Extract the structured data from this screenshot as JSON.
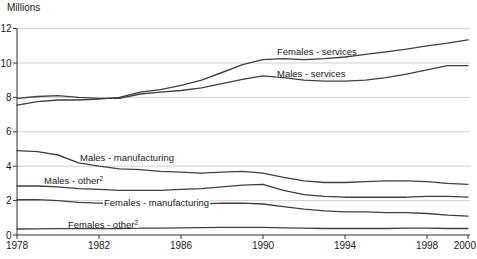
{
  "chart_data": {
    "type": "line",
    "title": "",
    "ylabel": "Millions",
    "xlabel": "",
    "xlim": [
      1978,
      2000
    ],
    "ylim": [
      0,
      12
    ],
    "x_ticks": [
      1978,
      1982,
      1986,
      1990,
      1994,
      1998,
      2000
    ],
    "y_ticks": [
      0,
      2,
      4,
      6,
      8,
      10,
      12
    ],
    "grid": "horizontal",
    "legend_position": "inline-labels",
    "colors": {
      "line": "#3f3f3f",
      "grid": "#cccccc",
      "axis": "#333333",
      "text": "#1a1a1a",
      "label_bg": "#ffffff"
    },
    "x": [
      1978,
      1979,
      1980,
      1981,
      1982,
      1983,
      1984,
      1985,
      1986,
      1987,
      1988,
      1989,
      1990,
      1991,
      1992,
      1993,
      1994,
      1995,
      1996,
      1997,
      1998,
      1999,
      2000
    ],
    "series": [
      {
        "id": "females-services",
        "name": "Females - services",
        "label": {
          "text": "Females - services",
          "sup": "",
          "x": 277,
          "y": 55
        },
        "values": [
          7.55,
          7.75,
          7.85,
          7.85,
          7.9,
          8.0,
          8.3,
          8.45,
          8.7,
          9.0,
          9.45,
          9.9,
          10.2,
          10.25,
          10.2,
          10.25,
          10.35,
          10.5,
          10.65,
          10.8,
          11.0,
          11.15,
          11.35
        ]
      },
      {
        "id": "males-services",
        "name": "Males - services",
        "label": {
          "text": "Males - services",
          "sup": "",
          "x": 277,
          "y": 77
        },
        "values": [
          7.95,
          8.05,
          8.1,
          8.0,
          7.95,
          7.95,
          8.2,
          8.3,
          8.4,
          8.55,
          8.8,
          9.05,
          9.25,
          9.15,
          9.0,
          8.95,
          8.95,
          9.0,
          9.15,
          9.35,
          9.6,
          9.85,
          9.85
        ]
      },
      {
        "id": "males-manufacturing",
        "name": "Males - manufacturing",
        "label": {
          "text": "Males - manufacturing",
          "sup": "",
          "x": 80,
          "y": 161
        },
        "values": [
          4.9,
          4.85,
          4.65,
          4.2,
          4.0,
          3.85,
          3.8,
          3.7,
          3.65,
          3.6,
          3.65,
          3.7,
          3.6,
          3.35,
          3.15,
          3.05,
          3.05,
          3.1,
          3.15,
          3.15,
          3.1,
          3.0,
          2.95
        ]
      },
      {
        "id": "males-other",
        "name": "Males - other",
        "label": {
          "text": "Males - other",
          "sup": "2",
          "x": 44,
          "y": 184
        },
        "values": [
          2.85,
          2.85,
          2.8,
          2.7,
          2.65,
          2.6,
          2.6,
          2.6,
          2.65,
          2.7,
          2.8,
          2.9,
          2.95,
          2.6,
          2.35,
          2.25,
          2.2,
          2.2,
          2.2,
          2.2,
          2.25,
          2.25,
          2.2
        ]
      },
      {
        "id": "females-manufacturing",
        "name": "Females - manufacturing",
        "label": {
          "text": "Females - manufacturing",
          "sup": "",
          "x": 104,
          "y": 206
        },
        "values": [
          2.05,
          2.05,
          2.0,
          1.9,
          1.85,
          1.8,
          1.8,
          1.8,
          1.8,
          1.8,
          1.85,
          1.85,
          1.8,
          1.65,
          1.5,
          1.4,
          1.35,
          1.35,
          1.3,
          1.3,
          1.25,
          1.15,
          1.1
        ]
      },
      {
        "id": "females-other",
        "name": "Females - other",
        "label": {
          "text": "Females - other",
          "sup": "2",
          "x": 68,
          "y": 228
        },
        "values": [
          0.35,
          0.36,
          0.37,
          0.37,
          0.37,
          0.38,
          0.4,
          0.4,
          0.42,
          0.43,
          0.45,
          0.45,
          0.45,
          0.42,
          0.4,
          0.38,
          0.38,
          0.38,
          0.38,
          0.4,
          0.4,
          0.38,
          0.38
        ]
      }
    ]
  }
}
